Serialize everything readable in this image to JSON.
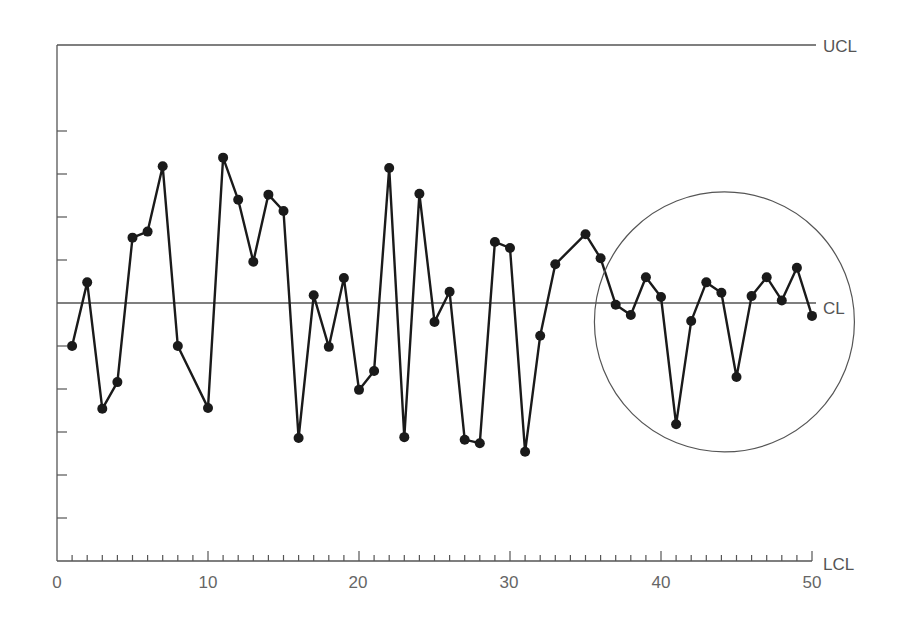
{
  "chart_data": {
    "type": "line",
    "title": "",
    "xlabel": "",
    "ylabel": "",
    "chart_kind": "control chart",
    "xlim": [
      0,
      50
    ],
    "ylim": [
      -3,
      3
    ],
    "x_ticks": [
      0,
      10,
      20,
      30,
      40,
      50
    ],
    "x_minor_tick_step": 1,
    "y_tick_step": 0.5,
    "y_tick_labels_shown": false,
    "grid": false,
    "control_limits": [
      {
        "name": "UCL",
        "value": 3
      },
      {
        "name": "CL",
        "value": 0
      },
      {
        "name": "LCL",
        "value": -3
      }
    ],
    "series": [
      {
        "name": "process",
        "x": [
          1,
          2,
          3,
          4,
          5,
          6,
          7,
          8,
          10,
          11,
          12,
          13,
          14,
          15,
          16,
          17,
          18,
          19,
          20,
          21,
          22,
          23,
          24,
          25,
          26,
          27,
          28,
          29,
          30,
          31,
          32,
          33,
          35,
          36,
          37,
          38,
          39,
          40,
          41,
          42,
          43,
          44,
          45,
          46,
          47,
          48,
          49,
          50
        ],
        "values": [
          -0.5,
          0.24,
          -1.23,
          -0.92,
          0.76,
          0.83,
          1.59,
          -0.5,
          -1.22,
          1.69,
          1.2,
          0.48,
          1.26,
          1.07,
          -1.57,
          0.09,
          -0.51,
          0.29,
          -1.01,
          -0.79,
          1.57,
          -1.56,
          1.27,
          -0.22,
          0.13,
          -1.59,
          -1.63,
          0.71,
          0.64,
          -1.73,
          -0.38,
          0.45,
          0.8,
          0.52,
          -0.02,
          -0.14,
          0.3,
          0.07,
          -1.41,
          -0.21,
          0.24,
          0.12,
          -0.86,
          0.08,
          0.3,
          0.03,
          0.41,
          -0.15
        ]
      }
    ],
    "annotations": [
      {
        "type": "circle",
        "description": "highlighted region around samples ~37-50 near CL",
        "center_x": 44.2,
        "center_y": -0.22,
        "radius_px": 130
      }
    ]
  },
  "labels": {
    "ucl": "UCL",
    "cl": "CL",
    "lcl": "LCL",
    "x_ticks": [
      "0",
      "10",
      "20",
      "30",
      "40",
      "50"
    ]
  },
  "colors": {
    "line": "#1a1a1a",
    "axis": "#555555",
    "text": "#666666"
  }
}
